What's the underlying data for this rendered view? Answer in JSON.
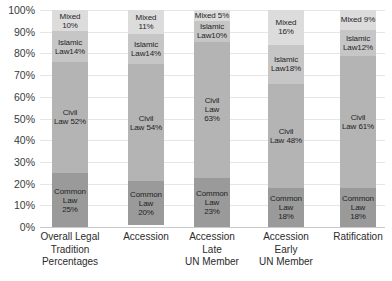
{
  "chart_data": {
    "type": "bar",
    "subtype": "stacked-bar-100pct",
    "title": "",
    "xlabel": "",
    "ylabel": "",
    "ylim": [
      0,
      100
    ],
    "grid": true,
    "legend": "none",
    "value_suffix": "%",
    "categories": [
      "Overall Legal\nTradition\nPercentages",
      "Accession",
      "Accession\nLate\nUN Member",
      "Accession\nEarly\nUN Member",
      "Ratification"
    ],
    "yticks": [
      "0%",
      "10%",
      "20%",
      "30%",
      "40%",
      "50%",
      "60%",
      "70%",
      "80%",
      "90%",
      "100%"
    ],
    "ytick_values": [
      0,
      10,
      20,
      30,
      40,
      50,
      60,
      70,
      80,
      90,
      100
    ],
    "series": [
      {
        "name": "Common Law",
        "color": "#9a9a9a",
        "values": [
          25,
          20,
          23,
          18,
          18
        ],
        "labels": [
          "Common\nLaw\n25%",
          "Common\nLaw\n20%",
          "Common\nLaw\n23%",
          "Common\nLaw\n18%",
          "Common\nLaw\n18%"
        ]
      },
      {
        "name": "Civil Law",
        "color": "#b4b4b4",
        "values": [
          52,
          54,
          63,
          48,
          61
        ],
        "labels": [
          "Civil\nLaw 52%",
          "Civil\nLaw 54%",
          "Civil\nLaw\n63%",
          "Civil\nLaw 48%",
          "Civil\nLaw 61%"
        ]
      },
      {
        "name": "Islamic Law",
        "color": "#c6c6c6",
        "values": [
          14,
          14,
          10,
          18,
          12
        ],
        "labels": [
          "Islamic\nLaw14%",
          "Islamic\nLaw14%",
          "Islamic\nLaw10%",
          "Islamic\nLaw18%",
          "Islamic\nLaw12%"
        ]
      },
      {
        "name": "Mixed",
        "color": "#dcdcdc",
        "values": [
          10,
          11,
          5,
          16,
          9
        ],
        "labels": [
          "Mixed\n10%",
          "Mixed\n11%",
          "Mixed 5%",
          "Mixed\n16%",
          "Mixed 9%"
        ]
      }
    ]
  },
  "colors": {
    "gridline": "#e6e6e6",
    "axis": "#c9c9c9",
    "text": "#2b2b2b",
    "background": "#ffffff"
  }
}
